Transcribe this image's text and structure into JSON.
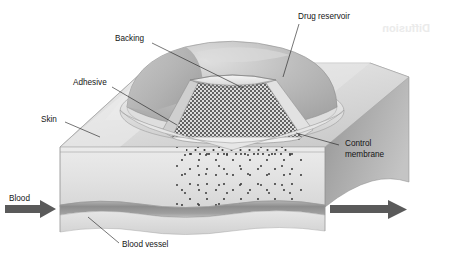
{
  "figure": {
    "background_color": "#ffffff"
  },
  "labels": {
    "drug_reservoir": "Drug reservoir",
    "backing": "Backing",
    "adhesive": "Adhesive",
    "skin": "Skin",
    "control_membrane_line1": "Control",
    "control_membrane_line2": "membrane",
    "blood": "Blood",
    "blood_vessel": "Blood vessel",
    "ghost_bleedthrough": "Diffusion"
  },
  "colors": {
    "page_background": "#ffffff",
    "skin_top_surface": "#d9d9d9",
    "skin_front_face": "#e3e3e3",
    "skin_right_face": "#a8a8a8",
    "patch_dome": "#b9b9b9",
    "patch_rim": "#eaeaea",
    "reservoir_particles": "#3a3a3a",
    "blood_vessel": "#9b9b9b",
    "arrow": "#585858",
    "leader_line": "#1a1a1a",
    "label_text": "#151515",
    "ghost_text": "#e9e9e9"
  },
  "elements": {
    "left_arrow_name": "blood-inflow-arrow",
    "right_arrow_name": "blood-outflow-arrow",
    "patch_name": "transdermal-patch",
    "reservoir_name": "drug-reservoir-cutaway",
    "skin_block_name": "skin-tissue-block",
    "vessel_name": "blood-vessel-band"
  }
}
